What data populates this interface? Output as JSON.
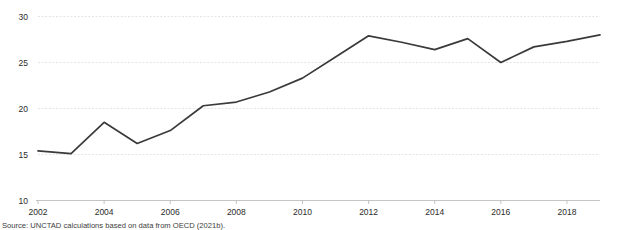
{
  "chart_data": {
    "type": "line",
    "title": "",
    "subtitle": "",
    "xlabel": "",
    "ylabel": "",
    "x": [
      2002,
      2003,
      2004,
      2005,
      2006,
      2007,
      2008,
      2009,
      2010,
      2011,
      2012,
      2013,
      2014,
      2015,
      2016,
      2017,
      2018,
      2019
    ],
    "values": [
      15.4,
      15.1,
      18.5,
      16.2,
      17.6,
      20.3,
      20.7,
      21.8,
      23.3,
      25.6,
      27.9,
      27.2,
      26.4,
      27.6,
      25.0,
      26.7,
      27.3,
      28.0
    ],
    "series": [
      {
        "name": "",
        "values": [
          15.4,
          15.1,
          18.5,
          16.2,
          17.6,
          20.3,
          20.7,
          21.8,
          23.3,
          25.6,
          27.9,
          27.2,
          26.4,
          27.6,
          25.0,
          26.7,
          27.3,
          28.0
        ]
      }
    ],
    "xlim": [
      2002,
      2019
    ],
    "ylim": [
      10,
      30
    ],
    "yticks": [
      10,
      15,
      20,
      25,
      30
    ],
    "ytick_labels": [
      "10",
      "15",
      "20",
      "25",
      "30"
    ],
    "xticks": [
      2002,
      2004,
      2006,
      2008,
      2010,
      2012,
      2014,
      2016,
      2018
    ],
    "xtick_labels": [
      "2002",
      "2004",
      "2006",
      "2008",
      "2010",
      "2012",
      "2014",
      "2016",
      "2018"
    ],
    "grid": true,
    "grid_axis": "y",
    "legend": false,
    "legend_position": "none",
    "line_color": "#3a3a3a",
    "grid_color": "#d9d9d9",
    "axis_color": "#b5b5b5",
    "annotations": []
  },
  "figure": {
    "source_note": "Source: UNCTAD calculations based on data from OECD (2021b)."
  }
}
